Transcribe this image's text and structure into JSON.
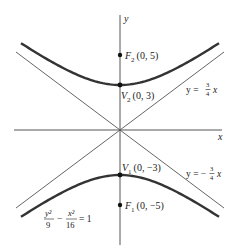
{
  "diagram": {
    "type": "hyperbola",
    "equation": {
      "numerator1": "y²",
      "denominator1": "9",
      "minus": "−",
      "numerator2": "x²",
      "denominator2": "16",
      "equals": "= 1"
    },
    "axes": {
      "x_label": "x",
      "y_label": "y"
    },
    "points": {
      "F2": {
        "name": "F",
        "sub": "2",
        "coords": "(0, 5)"
      },
      "V2": {
        "name": "V",
        "sub": "2",
        "coords": "(0, 3)"
      },
      "V1": {
        "name": "V",
        "sub": "1",
        "coords": "(0, −3)"
      },
      "F1": {
        "name": "F",
        "sub": "1",
        "coords": "(0, −5)"
      }
    },
    "asymptotes": {
      "positive": {
        "prefix": "y = ",
        "num": "3",
        "den": "4",
        "suffix": " x"
      },
      "negative": {
        "prefix": "y = −",
        "num": "3",
        "den": "4",
        "suffix": " x"
      }
    },
    "colors": {
      "curve": "#333333",
      "line": "#555555",
      "point": "#111111"
    }
  }
}
